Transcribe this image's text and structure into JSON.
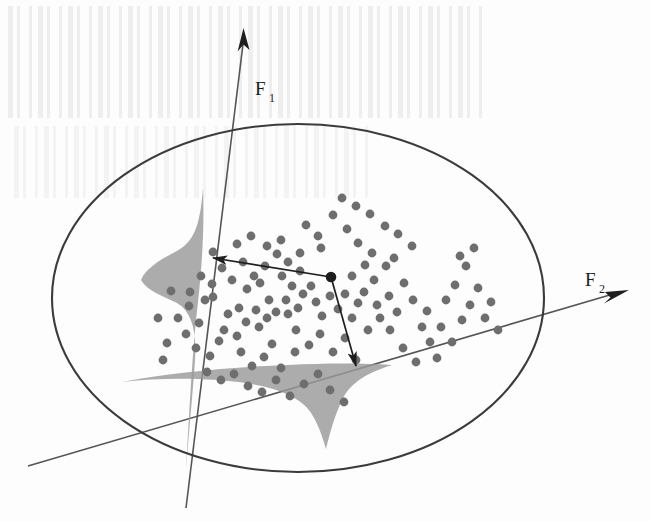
{
  "figure": {
    "axes": [
      {
        "id": "F1",
        "label": "F",
        "subscript": "1",
        "label_x": 258,
        "label_y": 95,
        "sub_x": 271,
        "sub_y": 101
      },
      {
        "id": "F2",
        "label": "F",
        "subscript": "2",
        "label_x": 588,
        "label_y": 286,
        "sub_x": 601,
        "sub_y": 292
      }
    ],
    "axis_lines": [
      {
        "id": "f1-axis",
        "x1": 243,
        "y1": 30,
        "x2": 186,
        "y2": 508,
        "arrow": "start"
      },
      {
        "id": "f2-axis",
        "x1": 28,
        "y1": 466,
        "x2": 627,
        "y2": 290,
        "arrow": "end"
      }
    ],
    "ellipse": {
      "cx": 298,
      "cy": 298,
      "rx": 246,
      "ry": 174,
      "stroke": "#3b3b3b",
      "stroke_width": 2.1
    },
    "highlight_point": {
      "x": 331,
      "y": 277,
      "r": 5.2
    },
    "projection_arrows": [
      {
        "id": "projection-to-f1",
        "x1": 331,
        "y1": 277,
        "x2": 209,
        "y2": 257,
        "target_axis": "F1"
      },
      {
        "id": "projection-to-f2",
        "x1": 331,
        "y1": 277,
        "x2": 358,
        "y2": 372,
        "target_axis": "F2"
      }
    ],
    "density_shapes": [
      {
        "id": "density-f1",
        "fill": "#9a9a9a",
        "opacity": 0.85,
        "axis": "F1",
        "side": "left"
      },
      {
        "id": "density-f2",
        "fill": "#9a9a9a",
        "opacity": 0.85,
        "axis": "F2",
        "side": "below"
      }
    ],
    "style": {
      "dot_color": "#6e6e6e",
      "dot_radius": 4.4,
      "line_color": "#2b2b2b",
      "density_fill": "#9a9a9a",
      "ellipse_color": "#3b3b3b",
      "background": "#fdfdfd"
    }
  },
  "chart_data": {
    "type": "scatter",
    "xlabel": "",
    "ylabel": "",
    "legend": [],
    "grid": false,
    "axis_labels": [
      "F1",
      "F2"
    ],
    "annotations": [
      {
        "text": "F1",
        "x": 258,
        "y": 95
      },
      {
        "text": "F2",
        "x": 588,
        "y": 286
      }
    ],
    "points": [
      [
        331,
        277
      ],
      [
        318,
        236
      ],
      [
        372,
        253
      ],
      [
        300,
        253
      ],
      [
        260,
        283
      ],
      [
        282,
        276
      ],
      [
        269,
        300
      ],
      [
        247,
        289
      ],
      [
        239,
        308
      ],
      [
        205,
        300
      ],
      [
        189,
        306
      ],
      [
        213,
        297
      ],
      [
        167,
        343
      ],
      [
        199,
        323
      ],
      [
        224,
        330
      ],
      [
        241,
        352
      ],
      [
        259,
        327
      ],
      [
        272,
        344
      ],
      [
        288,
        314
      ],
      [
        296,
        330
      ],
      [
        303,
        294
      ],
      [
        292,
        286
      ],
      [
        311,
        286
      ],
      [
        316,
        302
      ],
      [
        322,
        316
      ],
      [
        330,
        296
      ],
      [
        338,
        309
      ],
      [
        345,
        294
      ],
      [
        352,
        318
      ],
      [
        358,
        303
      ],
      [
        298,
        308
      ],
      [
        286,
        300
      ],
      [
        276,
        312
      ],
      [
        267,
        318
      ],
      [
        256,
        310
      ],
      [
        246,
        322
      ],
      [
        237,
        336
      ],
      [
        228,
        314
      ],
      [
        219,
        341
      ],
      [
        210,
        356
      ],
      [
        252,
        366
      ],
      [
        264,
        357
      ],
      [
        281,
        368
      ],
      [
        295,
        352
      ],
      [
        309,
        345
      ],
      [
        320,
        334
      ],
      [
        333,
        352
      ],
      [
        345,
        338
      ],
      [
        356,
        360
      ],
      [
        368,
        330
      ],
      [
        380,
        318
      ],
      [
        389,
        296
      ],
      [
        397,
        312
      ],
      [
        404,
        283
      ],
      [
        413,
        300
      ],
      [
        422,
        327
      ],
      [
        430,
        342
      ],
      [
        437,
        358
      ],
      [
        446,
        300
      ],
      [
        455,
        285
      ],
      [
        462,
        320
      ],
      [
        470,
        305
      ],
      [
        333,
        215
      ],
      [
        347,
        229
      ],
      [
        358,
        243
      ],
      [
        365,
        265
      ],
      [
        374,
        280
      ],
      [
        386,
        266
      ],
      [
        394,
        258
      ],
      [
        300,
        271
      ],
      [
        288,
        262
      ],
      [
        277,
        254
      ],
      [
        265,
        266
      ],
      [
        254,
        276
      ],
      [
        243,
        262
      ],
      [
        232,
        280
      ],
      [
        222,
        268
      ],
      [
        212,
        284
      ],
      [
        201,
        276
      ],
      [
        190,
        292
      ],
      [
        178,
        318
      ],
      [
        186,
        334
      ],
      [
        196,
        348
      ],
      [
        207,
        372
      ],
      [
        221,
        380
      ],
      [
        234,
        374
      ],
      [
        248,
        386
      ],
      [
        262,
        392
      ],
      [
        276,
        380
      ],
      [
        290,
        396
      ],
      [
        304,
        384
      ],
      [
        318,
        374
      ],
      [
        330,
        390
      ],
      [
        344,
        402
      ],
      [
        158,
        318
      ],
      [
        171,
        291
      ],
      [
        163,
        360
      ],
      [
        213,
        252
      ],
      [
        267,
        246
      ],
      [
        281,
        240
      ],
      [
        237,
        244
      ],
      [
        251,
        236
      ],
      [
        306,
        225
      ],
      [
        321,
        248
      ],
      [
        352,
        276
      ],
      [
        364,
        292
      ],
      [
        377,
        305
      ],
      [
        390,
        330
      ],
      [
        403,
        348
      ],
      [
        416,
        362
      ],
      [
        427,
        311
      ],
      [
        441,
        327
      ],
      [
        452,
        342
      ],
      [
        466,
        266
      ],
      [
        478,
        288
      ],
      [
        491,
        302
      ],
      [
        460,
        256
      ],
      [
        474,
        248
      ],
      [
        485,
        318
      ],
      [
        498,
        330
      ],
      [
        412,
        246
      ],
      [
        398,
        234
      ],
      [
        385,
        226
      ],
      [
        370,
        214
      ],
      [
        356,
        206
      ],
      [
        342,
        198
      ]
    ]
  }
}
